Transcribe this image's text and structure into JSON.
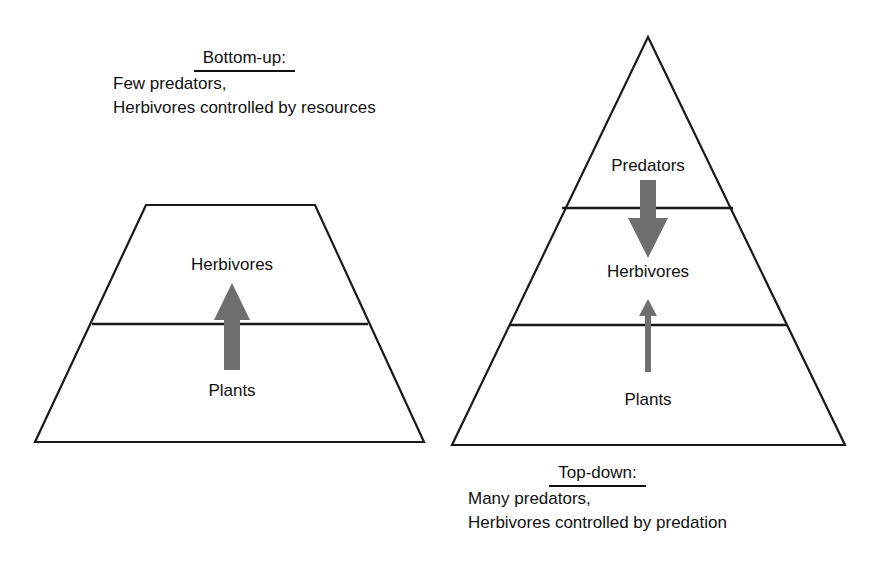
{
  "figure": {
    "title_left": "Bottom-up:",
    "title_right": "Top-down:"
  },
  "left_panel": {
    "caption": {
      "heading": "Bottom-up:",
      "line1": "Few predators,",
      "line2": "Herbivores controlled by resources"
    },
    "shape": "trapezoid",
    "tiers": [
      {
        "name": "herbivores",
        "label": "Herbivores"
      },
      {
        "name": "plants",
        "label": "Plants"
      }
    ],
    "arrow": {
      "name": "bottom-up-arrow",
      "direction": "up",
      "weight": "thick",
      "from": "Plants",
      "to": "Herbivores",
      "color": "#6f6f6f"
    }
  },
  "right_panel": {
    "caption": {
      "heading": "Top-down:",
      "line1": "Many predators,",
      "line2": "Herbivores controlled by predation"
    },
    "shape": "pyramid",
    "tiers": [
      {
        "name": "predators",
        "label": "Predators"
      },
      {
        "name": "herbivores",
        "label": "Herbivores"
      },
      {
        "name": "plants",
        "label": "Plants"
      }
    ],
    "arrows": [
      {
        "name": "top-down-arrow",
        "direction": "down",
        "weight": "thick",
        "from": "Predators",
        "to": "Herbivores",
        "color": "#6f6f6f"
      },
      {
        "name": "resource-arrow",
        "direction": "up",
        "weight": "thin",
        "from": "Plants",
        "to": "Herbivores",
        "color": "#6f6f6f"
      }
    ]
  },
  "colors": {
    "outline": "#1a1a1a",
    "arrow_gray": "#6f6f6f",
    "background": "#ffffff",
    "text": "#111111"
  }
}
